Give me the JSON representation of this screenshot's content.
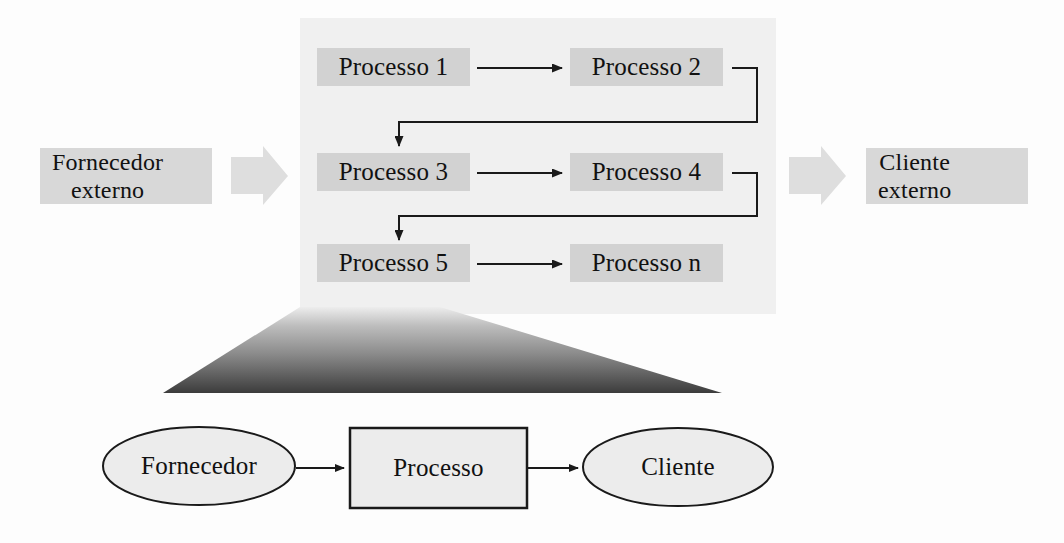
{
  "diagram": {
    "colors": {
      "panel_fill": "#f0f0f0",
      "chip_fill": "#d2d2d2",
      "external_chip_fill": "#d8d8d8",
      "shape_fill": "#ececec",
      "stroke": "#1a1a1a",
      "triangle_top": "#e9e9e9",
      "triangle_bottom": "#3b3b3b",
      "block_arrow_fill": "#dedede"
    },
    "external_supplier": {
      "label": "Fornecedor\nexterno",
      "x": 40,
      "y": 148,
      "w": 160,
      "h": 56
    },
    "external_customer": {
      "label": "Cliente\nexterno",
      "x": 866,
      "y": 148,
      "w": 150,
      "h": 56
    },
    "inbound_arrow": {
      "name": "block-arrow-right-inbound"
    },
    "outbound_arrow": {
      "name": "block-arrow-right-outbound"
    },
    "panel": {
      "x": 300,
      "y": 18,
      "w": 476,
      "h": 296
    },
    "process_chips": [
      {
        "label": "Processo 1",
        "x": 317,
        "y": 52,
        "w": 153,
        "h": 31,
        "row": 1,
        "col": 1
      },
      {
        "label": "Processo 2",
        "x": 570,
        "y": 52,
        "w": 153,
        "h": 31,
        "row": 1,
        "col": 2
      },
      {
        "label": "Processo 3",
        "x": 317,
        "y": 157,
        "w": 153,
        "h": 31,
        "row": 2,
        "col": 1
      },
      {
        "label": "Processo 4",
        "x": 570,
        "y": 157,
        "w": 153,
        "h": 31,
        "row": 2,
        "col": 2
      },
      {
        "label": "Processo 5",
        "x": 317,
        "y": 248,
        "w": 153,
        "h": 31,
        "row": 3,
        "col": 1
      },
      {
        "label": "Processo n",
        "x": 570,
        "y": 248,
        "w": 153,
        "h": 31,
        "row": 3,
        "col": 2
      }
    ],
    "flow_arrows": [
      {
        "name": "arrow-processo1-to-processo2",
        "from": "Processo 1",
        "to": "Processo 2"
      },
      {
        "name": "arrow-processo3-to-processo4",
        "from": "Processo 3",
        "to": "Processo 4"
      },
      {
        "name": "arrow-processo5-to-proceson",
        "from": "Processo 5",
        "to": "Processo n"
      },
      {
        "name": "arrow-processo2-to-processo3",
        "from": "Processo 2",
        "to": "Processo 3"
      },
      {
        "name": "arrow-processo4-to-processo5",
        "from": "Processo 4",
        "to": "Processo 5"
      }
    ],
    "funnel": {
      "name": "gradient-triangle",
      "apex_left_x": 300,
      "apex_right_x": 440,
      "apex_y": 307,
      "base_left_x": 163,
      "base_right_x": 722,
      "base_y": 393
    },
    "bottom_model": {
      "supplier": {
        "label": "Fornecedor",
        "cx": 199,
        "cy": 466,
        "rx": 96,
        "ry": 39
      },
      "process": {
        "label": "Processo",
        "x": 350,
        "y": 428,
        "w": 177,
        "h": 80
      },
      "customer": {
        "label": "Cliente",
        "cx": 678,
        "cy": 467,
        "rx": 95,
        "ry": 39
      },
      "arrows": [
        {
          "name": "arrow-fornecedor-to-processo",
          "from": "Fornecedor",
          "to": "Processo"
        },
        {
          "name": "arrow-processo-to-cliente",
          "from": "Processo",
          "to": "Cliente"
        }
      ]
    }
  }
}
